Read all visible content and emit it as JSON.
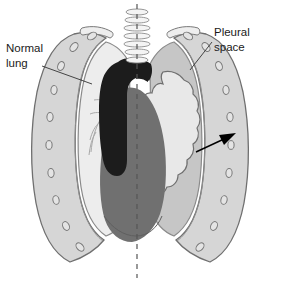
{
  "figure": {
    "type": "anatomical-illustration",
    "background_color": "#ffffff",
    "width": 281,
    "height": 282
  },
  "labels": {
    "normal_lung": {
      "line1": "Normal",
      "line2": "lung",
      "x": 8,
      "y": 52
    },
    "pleural_space": {
      "line1": "Pleural",
      "line2": "space",
      "x": 214,
      "y": 33
    }
  },
  "colors": {
    "normal_lung_fill": "#ededed",
    "collapsed_lung_fill": "#e8e8e8",
    "pleural_space_fill": "#c6c6c6",
    "chest_wall_fill": "#d6d6d6",
    "rib_outline": "#8a8a8a",
    "heart_fill": "#707070",
    "bronchi_fill": "#1c1c1c",
    "trachea_fill": "#f4f4f4",
    "outline": "#6f6f6f",
    "text": "#1a1a1a",
    "arrow": "#000000",
    "midline": "#555555"
  },
  "structures": [
    {
      "name": "trachea",
      "description": "Cartilage ring ladder at top center"
    },
    {
      "name": "main-bronchi",
      "description": "Dark branching airway below trachea"
    },
    {
      "name": "heart-mediastinum",
      "description": "Medium gray central mass"
    },
    {
      "name": "normal-lung",
      "description": "Fully inflated left-of-image lung with bronchial markings"
    },
    {
      "name": "collapsed-lung",
      "description": "Scalloped, shrunken lung in right-of-image hemithorax"
    },
    {
      "name": "pleural-space",
      "description": "Gray air-filled space surrounding the collapsed lung"
    },
    {
      "name": "rib-cage",
      "description": "Outer chest wall with rib cross-sections"
    },
    {
      "name": "clavicles",
      "description": "Paired bones above each lung apex"
    },
    {
      "name": "midline",
      "description": "Vertical dashed reference line"
    },
    {
      "name": "collapse-arrow",
      "description": "Arrow indicating direction of lung collapse / air accumulation"
    }
  ]
}
